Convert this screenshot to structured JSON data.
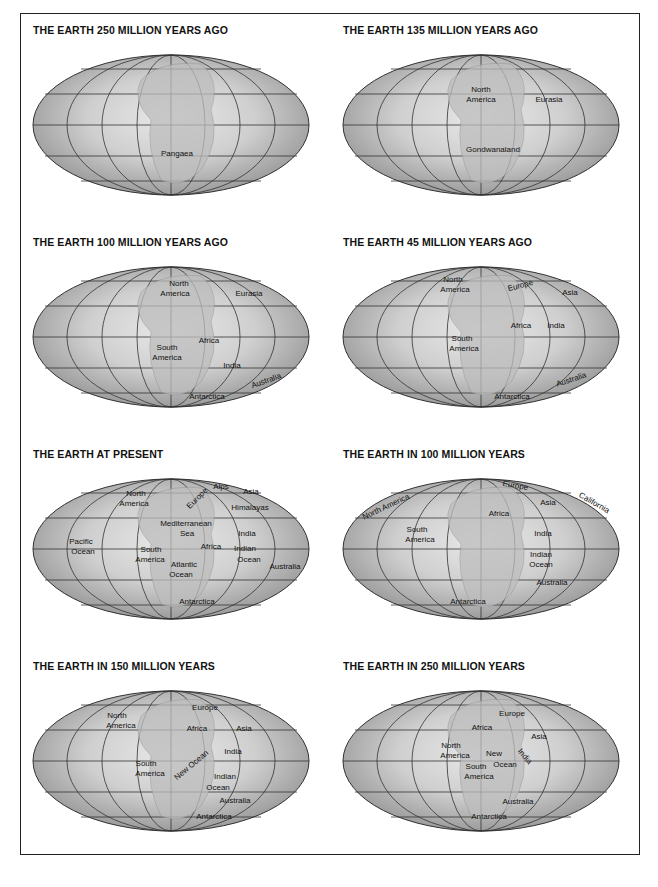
{
  "panels": [
    {
      "title": "THE EARTH 250 MILLION YEARS AGO",
      "labels": [
        {
          "text": "Pangaea",
          "x": 156,
          "y": 106,
          "rot": 0
        }
      ]
    },
    {
      "title": "THE EARTH 135 MILLION YEARS AGO",
      "labels": [
        {
          "text": "North",
          "x": 150,
          "y": 42,
          "rot": 0
        },
        {
          "text": "America",
          "x": 150,
          "y": 52,
          "rot": 0
        },
        {
          "text": "Eurasia",
          "x": 218,
          "y": 52,
          "rot": 0
        },
        {
          "text": "Gondwanaland",
          "x": 162,
          "y": 102,
          "rot": 0
        }
      ]
    },
    {
      "title": "THE EARTH 100 MILLION YEARS AGO",
      "labels": [
        {
          "text": "North",
          "x": 158,
          "y": 24,
          "rot": 0
        },
        {
          "text": "America",
          "x": 154,
          "y": 34,
          "rot": 0
        },
        {
          "text": "Eurasia",
          "x": 228,
          "y": 34,
          "rot": 0
        },
        {
          "text": "Africa",
          "x": 188,
          "y": 81,
          "rot": 0
        },
        {
          "text": "South",
          "x": 146,
          "y": 88,
          "rot": 0
        },
        {
          "text": "America",
          "x": 146,
          "y": 98,
          "rot": 0
        },
        {
          "text": "India",
          "x": 211,
          "y": 106,
          "rot": 0
        },
        {
          "text": "Australia",
          "x": 246,
          "y": 121,
          "rot": -20
        },
        {
          "text": "Antarctica",
          "x": 186,
          "y": 137,
          "rot": 0
        }
      ]
    },
    {
      "title": "THE EARTH 45 MILLION YEARS AGO",
      "labels": [
        {
          "text": "North",
          "x": 122,
          "y": 20,
          "rot": 0
        },
        {
          "text": "America",
          "x": 124,
          "y": 30,
          "rot": 0
        },
        {
          "text": "Europe",
          "x": 190,
          "y": 26,
          "rot": -15
        },
        {
          "text": "Asia",
          "x": 239,
          "y": 33,
          "rot": 0
        },
        {
          "text": "Africa",
          "x": 190,
          "y": 66,
          "rot": 0
        },
        {
          "text": "India",
          "x": 225,
          "y": 66,
          "rot": 0
        },
        {
          "text": "South",
          "x": 131,
          "y": 79,
          "rot": 0
        },
        {
          "text": "America",
          "x": 133,
          "y": 89,
          "rot": 0
        },
        {
          "text": "Australia",
          "x": 241,
          "y": 120,
          "rot": -18
        },
        {
          "text": "Antarctica",
          "x": 181,
          "y": 137,
          "rot": 0
        }
      ]
    },
    {
      "title": "THE EARTH AT PRESENT",
      "labels": [
        {
          "text": "North",
          "x": 115,
          "y": 22,
          "rot": 0
        },
        {
          "text": "America",
          "x": 113,
          "y": 32,
          "rot": 0
        },
        {
          "text": "Europe",
          "x": 178,
          "y": 26,
          "rot": -45
        },
        {
          "text": "Alps",
          "x": 200,
          "y": 15,
          "rot": 0
        },
        {
          "text": "Asia",
          "x": 230,
          "y": 20,
          "rot": 0
        },
        {
          "text": "Himalayas",
          "x": 229,
          "y": 36,
          "rot": 0
        },
        {
          "text": "Mediterranean",
          "x": 165,
          "y": 52,
          "rot": 0
        },
        {
          "text": "Sea",
          "x": 166,
          "y": 62,
          "rot": 0
        },
        {
          "text": "India",
          "x": 226,
          "y": 62,
          "rot": 0
        },
        {
          "text": "Pacific",
          "x": 60,
          "y": 70,
          "rot": 0
        },
        {
          "text": "Ocean",
          "x": 62,
          "y": 80,
          "rot": 0
        },
        {
          "text": "South",
          "x": 130,
          "y": 78,
          "rot": 0
        },
        {
          "text": "Africa",
          "x": 190,
          "y": 75,
          "rot": 0
        },
        {
          "text": "Indian",
          "x": 224,
          "y": 77,
          "rot": 0
        },
        {
          "text": "America",
          "x": 129,
          "y": 88,
          "rot": 0
        },
        {
          "text": "Ocean",
          "x": 228,
          "y": 88,
          "rot": 0
        },
        {
          "text": "Atlantic",
          "x": 163,
          "y": 93,
          "rot": 0
        },
        {
          "text": "Australia",
          "x": 264,
          "y": 95,
          "rot": 0
        },
        {
          "text": "Ocean",
          "x": 160,
          "y": 103,
          "rot": 0
        },
        {
          "text": "Antarctica",
          "x": 176,
          "y": 130,
          "rot": 0
        }
      ]
    },
    {
      "title": "THE EARTH IN 100 MILLION YEARS",
      "labels": [
        {
          "text": "Europe",
          "x": 184,
          "y": 14,
          "rot": 10
        },
        {
          "text": "North America",
          "x": 56,
          "y": 35,
          "rot": -25
        },
        {
          "text": "California",
          "x": 262,
          "y": 31,
          "rot": 30
        },
        {
          "text": "Asia",
          "x": 217,
          "y": 31,
          "rot": 0
        },
        {
          "text": "Africa",
          "x": 168,
          "y": 42,
          "rot": 0
        },
        {
          "text": "South",
          "x": 86,
          "y": 58,
          "rot": 0
        },
        {
          "text": "America",
          "x": 89,
          "y": 68,
          "rot": 0
        },
        {
          "text": "India",
          "x": 212,
          "y": 62,
          "rot": 0
        },
        {
          "text": "Indian",
          "x": 210,
          "y": 83,
          "rot": 0
        },
        {
          "text": "Ocean",
          "x": 210,
          "y": 93,
          "rot": 0
        },
        {
          "text": "Australia",
          "x": 221,
          "y": 111,
          "rot": 0
        },
        {
          "text": "Antarctica",
          "x": 137,
          "y": 130,
          "rot": 0
        }
      ]
    },
    {
      "title": "THE EARTH IN 150 MILLION YEARS",
      "labels": [
        {
          "text": "Europe",
          "x": 184,
          "y": 24,
          "rot": 0
        },
        {
          "text": "North",
          "x": 96,
          "y": 32,
          "rot": 0
        },
        {
          "text": "America",
          "x": 100,
          "y": 42,
          "rot": 0
        },
        {
          "text": "Africa",
          "x": 176,
          "y": 45,
          "rot": 0
        },
        {
          "text": "Asia",
          "x": 223,
          "y": 45,
          "rot": 0
        },
        {
          "text": "India",
          "x": 212,
          "y": 68,
          "rot": 0
        },
        {
          "text": "New Ocean",
          "x": 172,
          "y": 81,
          "rot": -40
        },
        {
          "text": "South",
          "x": 125,
          "y": 80,
          "rot": 0
        },
        {
          "text": "America",
          "x": 129,
          "y": 90,
          "rot": 0
        },
        {
          "text": "Indian",
          "x": 204,
          "y": 93,
          "rot": 0
        },
        {
          "text": "Ocean",
          "x": 197,
          "y": 104,
          "rot": 0
        },
        {
          "text": "Australia",
          "x": 214,
          "y": 117,
          "rot": 0
        },
        {
          "text": "Antarctica",
          "x": 193,
          "y": 133,
          "rot": 0
        }
      ]
    },
    {
      "title": "THE EARTH IN 250 MILLION YEARS",
      "labels": [
        {
          "text": "Europe",
          "x": 181,
          "y": 30,
          "rot": 0
        },
        {
          "text": "Africa",
          "x": 151,
          "y": 44,
          "rot": 0
        },
        {
          "text": "Asia",
          "x": 208,
          "y": 53,
          "rot": 0
        },
        {
          "text": "North",
          "x": 120,
          "y": 62,
          "rot": 0
        },
        {
          "text": "America",
          "x": 124,
          "y": 72,
          "rot": 0
        },
        {
          "text": "New",
          "x": 163,
          "y": 70,
          "rot": 0
        },
        {
          "text": "India",
          "x": 192,
          "y": 72,
          "rot": 50
        },
        {
          "text": "South",
          "x": 145,
          "y": 83,
          "rot": 0
        },
        {
          "text": "Ocean",
          "x": 174,
          "y": 81,
          "rot": 0
        },
        {
          "text": "America",
          "x": 148,
          "y": 93,
          "rot": 0
        },
        {
          "text": "Australia",
          "x": 187,
          "y": 118,
          "rot": 0
        },
        {
          "text": "Antarctica",
          "x": 158,
          "y": 133,
          "rot": 0
        }
      ]
    }
  ]
}
